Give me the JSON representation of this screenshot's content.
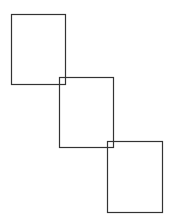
{
  "diagram": {
    "background": "#ffffff",
    "stroke_color": "#333333",
    "stroke_width": 1.2,
    "rectangles": [
      {
        "id": "rect-1",
        "x": 11,
        "y": 14,
        "width": 54,
        "height": 70
      },
      {
        "id": "rect-2",
        "x": 59,
        "y": 77,
        "width": 54,
        "height": 70
      },
      {
        "id": "rect-3",
        "x": 107,
        "y": 141,
        "width": 55,
        "height": 71
      }
    ]
  }
}
